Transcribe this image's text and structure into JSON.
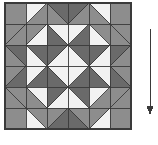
{
  "figure": {
    "background_color": "#ffffff",
    "width": 158,
    "height": 145
  },
  "palette": {
    "medium_gray": "#8d8d8d",
    "dark_gray": "#6a6a6a",
    "light": "#f2f2f2",
    "outline": "#3a3a3a",
    "arrow": "#3a3a3a"
  },
  "quilt": {
    "name": "quilt-block",
    "origin_x": 5,
    "origin_y": 3,
    "size": 126,
    "grid": 6,
    "cell": 21,
    "border_color": "#3a3a3a",
    "description": "Six-by-six grid of half-square triangle units forming a central light diamond with dark-gray sawtooth ring",
    "legend": [
      {
        "swatch": "medium_gray",
        "label": "Medium value fabric"
      },
      {
        "swatch": "dark_gray",
        "label": "Dark value fabric"
      },
      {
        "swatch": "light",
        "label": "Light value fabric"
      }
    ],
    "cells": [
      [
        {
          "type": "solid",
          "a": "medium_gray"
        },
        {
          "type": "hst",
          "dir": "tl",
          "a": "light",
          "b": "medium_gray"
        },
        {
          "type": "hst",
          "dir": "tr",
          "a": "dark_gray",
          "b": "medium_gray"
        },
        {
          "type": "hst",
          "dir": "tl",
          "a": "dark_gray",
          "b": "medium_gray"
        },
        {
          "type": "hst",
          "dir": "tr",
          "a": "light",
          "b": "medium_gray"
        },
        {
          "type": "solid",
          "a": "medium_gray"
        }
      ],
      [
        {
          "type": "hst",
          "dir": "tl",
          "a": "medium_gray",
          "b": "medium_gray"
        },
        {
          "type": "hst",
          "dir": "br",
          "a": "light",
          "b": "medium_gray"
        },
        {
          "type": "hst",
          "dir": "bl",
          "a": "dark_gray",
          "b": "light"
        },
        {
          "type": "hst",
          "dir": "br",
          "a": "dark_gray",
          "b": "light"
        },
        {
          "type": "hst",
          "dir": "bl",
          "a": "light",
          "b": "medium_gray"
        },
        {
          "type": "hst",
          "dir": "tr",
          "a": "medium_gray",
          "b": "medium_gray"
        }
      ],
      [
        {
          "type": "hst",
          "dir": "tr",
          "a": "dark_gray",
          "b": "medium_gray"
        },
        {
          "type": "hst",
          "dir": "tr",
          "a": "dark_gray",
          "b": "light"
        },
        {
          "type": "hst",
          "dir": "br",
          "a": "light",
          "b": "dark_gray"
        },
        {
          "type": "hst",
          "dir": "bl",
          "a": "light",
          "b": "dark_gray"
        },
        {
          "type": "hst",
          "dir": "tl",
          "a": "dark_gray",
          "b": "light"
        },
        {
          "type": "hst",
          "dir": "tl",
          "a": "dark_gray",
          "b": "medium_gray"
        }
      ],
      [
        {
          "type": "hst",
          "dir": "br",
          "a": "dark_gray",
          "b": "medium_gray"
        },
        {
          "type": "hst",
          "dir": "br",
          "a": "dark_gray",
          "b": "light"
        },
        {
          "type": "hst",
          "dir": "tr",
          "a": "light",
          "b": "dark_gray"
        },
        {
          "type": "hst",
          "dir": "tl",
          "a": "light",
          "b": "dark_gray"
        },
        {
          "type": "hst",
          "dir": "bl",
          "a": "dark_gray",
          "b": "light"
        },
        {
          "type": "hst",
          "dir": "bl",
          "a": "dark_gray",
          "b": "medium_gray"
        }
      ],
      [
        {
          "type": "hst",
          "dir": "bl",
          "a": "medium_gray",
          "b": "medium_gray"
        },
        {
          "type": "hst",
          "dir": "tr",
          "a": "light",
          "b": "medium_gray"
        },
        {
          "type": "hst",
          "dir": "tl",
          "a": "dark_gray",
          "b": "light"
        },
        {
          "type": "hst",
          "dir": "tr",
          "a": "dark_gray",
          "b": "light"
        },
        {
          "type": "hst",
          "dir": "tl",
          "a": "light",
          "b": "medium_gray"
        },
        {
          "type": "hst",
          "dir": "br",
          "a": "medium_gray",
          "b": "medium_gray"
        }
      ],
      [
        {
          "type": "solid",
          "a": "medium_gray"
        },
        {
          "type": "hst",
          "dir": "bl",
          "a": "light",
          "b": "medium_gray"
        },
        {
          "type": "hst",
          "dir": "br",
          "a": "dark_gray",
          "b": "medium_gray"
        },
        {
          "type": "hst",
          "dir": "bl",
          "a": "dark_gray",
          "b": "medium_gray"
        },
        {
          "type": "hst",
          "dir": "br",
          "a": "light",
          "b": "medium_gray"
        },
        {
          "type": "solid",
          "a": "medium_gray"
        }
      ]
    ]
  },
  "annotation": {
    "arrow": {
      "name": "direction-arrow",
      "label": "",
      "direction": "down",
      "x": 150,
      "y_start": 29,
      "y_end": 115,
      "color": "#3a3a3a",
      "line_width": 1,
      "head_width": 7,
      "head_length": 9
    }
  }
}
